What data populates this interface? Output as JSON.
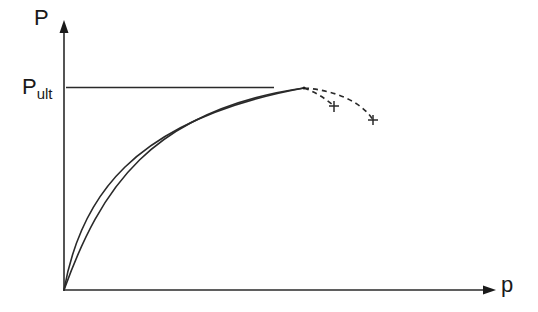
{
  "diagram": {
    "y_axis_label": "P",
    "x_axis_label": "p",
    "ultimate_label": {
      "main": "P",
      "sub": "ult"
    },
    "colors": {
      "stroke": "#2a2a2a",
      "background": "#ffffff"
    },
    "elements": [
      {
        "type": "axis",
        "name": "y-axis",
        "direction": "up"
      },
      {
        "type": "axis",
        "name": "x-axis",
        "direction": "right"
      },
      {
        "type": "line",
        "name": "ultimate-load-line",
        "style": "solid"
      },
      {
        "type": "curve",
        "name": "upper-curve",
        "style": "solid"
      },
      {
        "type": "curve",
        "name": "lower-curve",
        "style": "solid"
      },
      {
        "type": "curve",
        "name": "post-peak-branch-1",
        "style": "dashed",
        "end_marker": "+"
      },
      {
        "type": "curve",
        "name": "post-peak-branch-2",
        "style": "dashed",
        "end_marker": "+"
      }
    ]
  }
}
